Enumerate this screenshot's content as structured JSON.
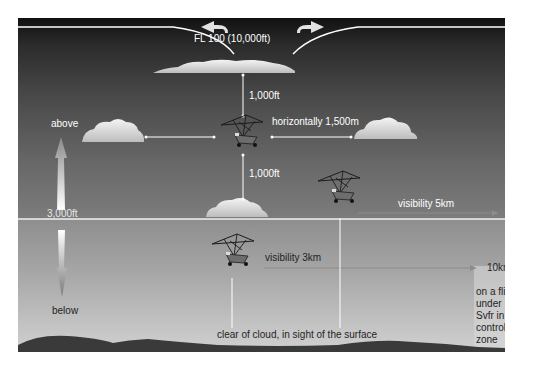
{
  "diagram": {
    "upper_limit_label": "FL 100 (10,000ft)",
    "altitude_boundary_label": "3,000ft",
    "above_label": "above",
    "below_label": "below",
    "vertical_separation_above": "1,000ft",
    "vertical_separation_below": "1,000ft",
    "horizontal_separation": "horizontally 1,500m",
    "visibility_above": "visibility 5km",
    "visibility_below": "visibility 3km",
    "visibility_svfr": "10km",
    "below_condition": "clear of cloud, in sight of the surface",
    "svfr_note": [
      "on a flight",
      "under",
      "Svfr in a",
      "controlled",
      "zone"
    ]
  },
  "colors": {
    "sky_top": "#111111",
    "sky_mid": "#4a4a4a",
    "sky_lower": "#a6a6a6",
    "ground": "#3a3a3a",
    "line": "#ffffff",
    "cloud": "#e8e8e8",
    "text_light": "#ffffff",
    "text_dark": "#1f1f1f"
  },
  "icons": {
    "aircraft": "microlight-trike-icon",
    "cloud": "cloud-icon",
    "arrow_up": "arrow-up-icon",
    "arrow_down": "arrow-down-icon",
    "arrow_left": "curved-arrow-left-icon",
    "arrow_right": "curved-arrow-right-icon"
  }
}
